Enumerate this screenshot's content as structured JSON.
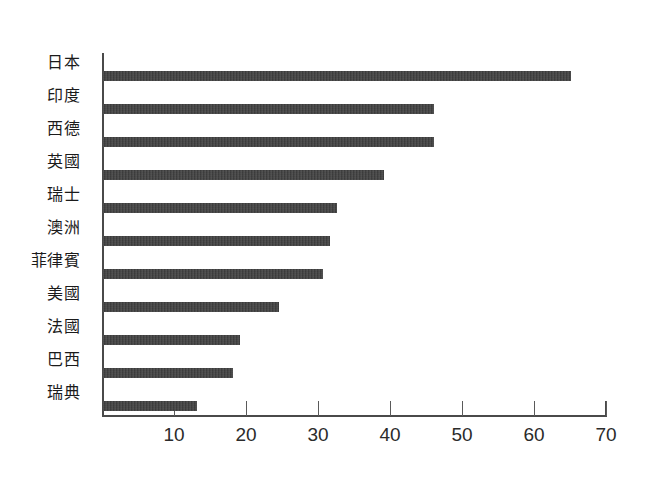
{
  "chart_data": {
    "type": "bar",
    "orientation": "horizontal",
    "title": "",
    "subtitle": "",
    "xlabel": "",
    "ylabel": "",
    "categories": [
      "日本",
      "印度",
      "西德",
      "英國",
      "瑞士",
      "澳洲",
      "菲律賓",
      "美國",
      "法國",
      "巴西",
      "瑞典"
    ],
    "values": [
      65,
      46,
      46,
      39,
      32.5,
      31.5,
      30.5,
      24.5,
      19,
      18,
      13
    ],
    "xlim": [
      0,
      70
    ],
    "xticks": [
      10,
      20,
      30,
      40,
      50,
      60,
      70
    ],
    "xticklabels": [
      "10",
      "20",
      "30",
      "40",
      "50",
      "60",
      "70"
    ],
    "grid": false,
    "legend": null,
    "bar_color": "#3b3b3b",
    "axis_color": "#4a4a4a",
    "background_color": "#ffffff"
  }
}
